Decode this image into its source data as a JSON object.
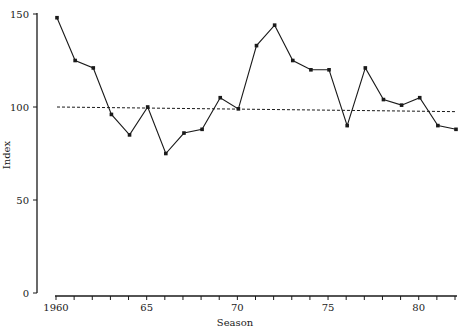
{
  "chart_data": {
    "type": "line",
    "title": "",
    "xlabel": "Season",
    "ylabel": "Index",
    "ylim": [
      0,
      150
    ],
    "xlim": [
      1960,
      1982
    ],
    "grid": false,
    "legend": null,
    "yticks": [
      0,
      50,
      100,
      150
    ],
    "ytick_labels": [
      "0",
      "50",
      "100",
      "150"
    ],
    "xticks": [
      1960,
      1965,
      1970,
      1975,
      1980
    ],
    "xtick_labels": [
      "1960",
      "65",
      "70",
      "75",
      "80"
    ],
    "x_minor_ticks_every": 1,
    "x": [
      1960,
      1961,
      1962,
      1963,
      1964,
      1965,
      1966,
      1967,
      1968,
      1969,
      1970,
      1971,
      1972,
      1973,
      1974,
      1975,
      1976,
      1977,
      1978,
      1979,
      1980,
      1981,
      1982
    ],
    "series": [
      {
        "name": "Index",
        "style": "solid line with point markers",
        "values": [
          148,
          125,
          121,
          96,
          85,
          100,
          75,
          86,
          88,
          105,
          99,
          133,
          144,
          125,
          120,
          120,
          90,
          121,
          104,
          101,
          105,
          90,
          88
        ]
      },
      {
        "name": "Trend",
        "style": "dashed line",
        "values_at_ends": {
          "1960": 100,
          "1982": 97.5
        }
      }
    ]
  }
}
